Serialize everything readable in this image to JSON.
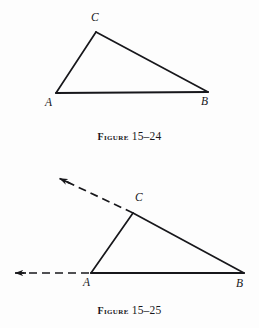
{
  "page": {
    "background": "#fdfdfd",
    "ink": "#17171b",
    "width": 259,
    "height": 328
  },
  "figures": [
    {
      "id": "figure-15-24",
      "caption_word": "Figure",
      "caption_number": "15–24",
      "description": "Triangle ABC with vertices A lower left, B lower right, C upper middle",
      "vertices": [
        {
          "label": "A",
          "x": 56,
          "y": 93,
          "label_x": 45,
          "label_y": 97
        },
        {
          "label": "B",
          "x": 208,
          "y": 92,
          "label_x": 201,
          "label_y": 96
        },
        {
          "label": "C",
          "x": 96,
          "y": 32,
          "label_x": 91,
          "label_y": 12
        }
      ],
      "edges": [
        {
          "from": "A",
          "to": "C",
          "style": "solid"
        },
        {
          "from": "C",
          "to": "B",
          "style": "solid"
        },
        {
          "from": "A",
          "to": "B",
          "style": "solid"
        }
      ],
      "rays": []
    },
    {
      "id": "figure-15-25",
      "caption_word": "Figure",
      "caption_number": "15–25",
      "description": "Triangle ABC with side AC extended beyond C as a dashed arrow and side AB extended beyond A as a dashed arrow",
      "vertices": [
        {
          "label": "A",
          "x": 91,
          "y": 273,
          "label_x": 83,
          "label_y": 277
        },
        {
          "label": "B",
          "x": 244,
          "y": 273,
          "label_x": 236,
          "label_y": 277
        },
        {
          "label": "C",
          "x": 133,
          "y": 213,
          "label_x": 135,
          "label_y": 192
        }
      ],
      "edges": [
        {
          "from": "A",
          "to": "C",
          "style": "solid"
        },
        {
          "from": "C",
          "to": "B",
          "style": "solid"
        },
        {
          "from": "A",
          "to": "B",
          "style": "solid"
        }
      ],
      "rays": [
        {
          "name": "ray-ac-extended",
          "from_x": 133,
          "from_y": 213,
          "to_x": 58,
          "to_y": 178,
          "style": "dashed",
          "arrow": true
        },
        {
          "name": "ray-ba-extended",
          "from_x": 91,
          "from_y": 273,
          "to_x": 10,
          "to_y": 273,
          "style": "dashed",
          "arrow": true
        }
      ]
    }
  ]
}
